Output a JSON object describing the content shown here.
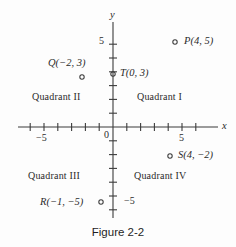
{
  "figure": {
    "caption": "Figure 2-2",
    "caption_top": 226
  },
  "axes": {
    "x_name": "x",
    "y_name": "y",
    "x_name_left": 222,
    "x_name_top": 121,
    "y_name_left": 110,
    "y_name_top": 10,
    "origin_px": {
      "x": 113,
      "y": 127
    },
    "unit_px": 13.8,
    "x_pixel_range": [
      18,
      218
    ],
    "y_pixel_range": [
      22,
      218
    ],
    "x_range": [
      -6.9,
      7.6
    ],
    "y_range": [
      -6.6,
      7.6
    ],
    "tick_half_len": 4,
    "tick_values_x": [
      -6,
      -5,
      -4,
      -3,
      -2,
      -1,
      1,
      2,
      3,
      4,
      5,
      6
    ],
    "tick_values_y": [
      -6,
      -5,
      -4,
      -3,
      -2,
      -1,
      1,
      2,
      3,
      4,
      5,
      6
    ],
    "tick_labels": [
      {
        "text": "0",
        "left": 104,
        "top": 130
      },
      {
        "text": "−5",
        "left": 36,
        "top": 133
      },
      {
        "text": "5",
        "left": 179,
        "top": 133
      },
      {
        "text": "5",
        "left": 99,
        "top": 36
      },
      {
        "text": "−5",
        "left": 124,
        "top": 196
      }
    ]
  },
  "points": [
    {
      "name": "P",
      "label": "P(4, 5)",
      "label_left": 184,
      "label_top": 36,
      "marker_left": 175,
      "marker_top": 42,
      "coords": [
        4,
        5
      ]
    },
    {
      "name": "Q",
      "label": "Q(−2, 3)",
      "label_left": 48,
      "label_top": 58,
      "marker_left": 82,
      "marker_top": 77,
      "coords": [
        -2,
        3
      ]
    },
    {
      "name": "T",
      "label": "T(0, 3)",
      "label_left": 120,
      "label_top": 68,
      "marker_left": 113,
      "marker_top": 74,
      "coords": [
        0,
        3
      ]
    },
    {
      "name": "S",
      "label": "S(4, −2)",
      "label_left": 178,
      "label_top": 150,
      "marker_left": 170,
      "marker_top": 156,
      "coords": [
        4,
        -2
      ]
    },
    {
      "name": "R",
      "label": "R(−1, −5)",
      "label_left": 40,
      "label_top": 197,
      "marker_left": 101,
      "marker_top": 202,
      "coords": [
        -1,
        -5
      ]
    }
  ],
  "quadrants": [
    {
      "key": "one",
      "label": "Quadrant I",
      "left": 137,
      "top": 92
    },
    {
      "key": "two",
      "label": "Quadrant II",
      "left": 32,
      "top": 92
    },
    {
      "key": "three",
      "label": "Quadrant III",
      "left": 28,
      "top": 171
    },
    {
      "key": "four",
      "label": "Quadrant IV",
      "left": 134,
      "top": 171
    }
  ],
  "colors": {
    "ink": "#3b3b3b",
    "text": "#2b2b2b",
    "background": "#fdfdfd"
  }
}
